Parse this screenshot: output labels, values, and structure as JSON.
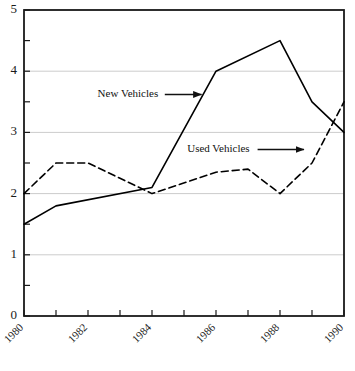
{
  "chart_data": {
    "type": "line",
    "title": "",
    "subtitle": "",
    "xlabel": "",
    "ylabel": "",
    "xlim": [
      1980,
      1990
    ],
    "ylim": [
      0,
      5
    ],
    "grid": true,
    "grid_axis": "y",
    "legend_position": "inline-annotations",
    "x": [
      1980,
      1981,
      1982,
      1983,
      1984,
      1985,
      1986,
      1987,
      1988,
      1989,
      1990
    ],
    "y_ticks": [
      "0",
      "1",
      "2",
      "3",
      "4",
      "5"
    ],
    "y_tick_values": [
      0,
      1,
      2,
      3,
      4,
      5
    ],
    "y_minor_tick_values": [
      0.5,
      1.5,
      2.5,
      3.5,
      4.5
    ],
    "x_ticks": [
      "1980",
      "1982",
      "1984",
      "1986",
      "1988",
      "1990"
    ],
    "x_tick_values": [
      1980,
      1982,
      1984,
      1986,
      1988,
      1990
    ],
    "x_minor_tick_values": [
      1981,
      1983,
      1985,
      1987,
      1989
    ],
    "x_tick_rotation": 45,
    "series": [
      {
        "name": "New Vehicles",
        "style": "solid",
        "color": "#000000",
        "x": [
          1980,
          1981,
          1984,
          1986,
          1988,
          1989,
          1990
        ],
        "values": [
          1.5,
          1.8,
          2.1,
          4.0,
          4.5,
          3.5,
          3.0
        ]
      },
      {
        "name": "Used Vehicles",
        "style": "dashed",
        "color": "#000000",
        "x": [
          1980,
          1981,
          1982,
          1984,
          1986,
          1987,
          1988,
          1989,
          1990
        ],
        "values": [
          2.0,
          2.5,
          2.5,
          2.0,
          2.35,
          2.4,
          2.0,
          2.5,
          3.5
        ]
      }
    ],
    "annotations": [
      {
        "label": "New Vehicles",
        "text_x": 1982.3,
        "text_y": 3.62,
        "arrow_from_x": 1984.4,
        "arrow_from_y": 3.62,
        "arrow_to_x": 1985.55,
        "arrow_to_y": 3.62
      },
      {
        "label": "Used Vehicles",
        "text_x": 1985.1,
        "text_y": 2.72,
        "arrow_from_x": 1987.3,
        "arrow_from_y": 2.72,
        "arrow_to_x": 1988.75,
        "arrow_to_y": 2.72
      }
    ],
    "colors": {
      "axis": "#1a1a1a",
      "grid": "#cccccc",
      "line": "#000000",
      "background": "#ffffff",
      "text": "#1a1a1a"
    }
  }
}
